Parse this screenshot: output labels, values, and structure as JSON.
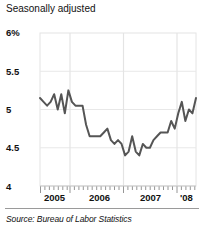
{
  "chart_data": {
    "type": "line",
    "title": "Seasonally adjusted",
    "subtitle": "",
    "source": "Source: Bureau of Labor Statistics",
    "xlabel": "",
    "ylabel": "",
    "ylim": [
      4,
      6
    ],
    "yticks": [
      4,
      4.5,
      5,
      5.5,
      6
    ],
    "ytick_labels": [
      "4",
      "4.5",
      "5",
      "5.5",
      "6%"
    ],
    "grid": true,
    "legend": false,
    "legend_position": "none",
    "line_color": "#555555",
    "xticks_major": [
      "2005",
      "2006",
      "2007",
      "'08"
    ],
    "xtick_labels": [
      "2005",
      "2006",
      "2007",
      "'08"
    ],
    "x_minor_ticks": "monthly",
    "x": [
      "2004-09",
      "2004-10",
      "2004-11",
      "2004-12",
      "2005-01",
      "2005-02",
      "2005-03",
      "2005-04",
      "2005-05",
      "2005-06",
      "2005-07",
      "2005-08",
      "2005-09",
      "2005-10",
      "2005-11",
      "2005-12",
      "2006-01",
      "2006-02",
      "2006-03",
      "2006-04",
      "2006-05",
      "2006-06",
      "2006-07",
      "2006-08",
      "2006-09",
      "2006-10",
      "2006-11",
      "2006-12",
      "2007-01",
      "2007-02",
      "2007-03",
      "2007-04",
      "2007-05",
      "2007-06",
      "2007-07",
      "2007-08",
      "2007-09",
      "2007-10",
      "2007-11",
      "2007-12",
      "2008-01",
      "2008-02",
      "2008-03",
      "2008-04",
      "2008-05"
    ],
    "values": [
      5.15,
      5.1,
      5.05,
      5.1,
      5.2,
      5.0,
      5.2,
      4.95,
      5.25,
      5.1,
      5.05,
      5.05,
      5.05,
      4.8,
      4.65,
      4.65,
      4.65,
      4.65,
      4.7,
      4.75,
      4.6,
      4.55,
      4.6,
      4.55,
      4.4,
      4.45,
      4.65,
      4.45,
      4.4,
      4.55,
      4.5,
      4.5,
      4.6,
      4.65,
      4.7,
      4.7,
      4.7,
      4.85,
      4.75,
      4.95,
      5.1,
      4.85,
      5.0,
      4.95,
      5.15
    ],
    "series": [
      {
        "name": "Unemployment rate",
        "values": [
          5.15,
          5.1,
          5.05,
          5.1,
          5.2,
          5.0,
          5.2,
          4.95,
          5.25,
          5.1,
          5.05,
          5.05,
          5.05,
          4.8,
          4.65,
          4.65,
          4.65,
          4.65,
          4.7,
          4.75,
          4.6,
          4.55,
          4.6,
          4.55,
          4.4,
          4.45,
          4.65,
          4.45,
          4.4,
          4.55,
          4.5,
          4.5,
          4.6,
          4.65,
          4.7,
          4.7,
          4.7,
          4.85,
          4.75,
          4.95,
          5.1,
          4.85,
          5.0,
          4.95,
          5.15
        ]
      }
    ]
  }
}
